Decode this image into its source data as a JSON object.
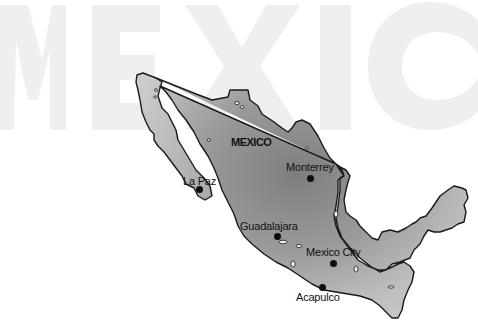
{
  "map": {
    "title_watermark": "MEXICO",
    "country_label": "MEXICO",
    "colors": {
      "background": "#ffffff",
      "watermark": "#efefef",
      "land_light": "#cfcfcf",
      "land_dark": "#7a7a7a",
      "outline": "#1a1a1a",
      "city_dot": "#0d0d0d",
      "text": "#111111"
    },
    "cities": [
      {
        "name": "Monterrey",
        "label_x": 286,
        "label_y": 161,
        "dot_x": 307,
        "dot_y": 175
      },
      {
        "name": "La Paz",
        "label_x": 183,
        "label_y": 175,
        "dot_x": 196,
        "dot_y": 186
      },
      {
        "name": "Guadalajara",
        "label_x": 240,
        "label_y": 220,
        "dot_x": 274,
        "dot_y": 233
      },
      {
        "name": "Mexico City",
        "label_x": 306,
        "label_y": 246,
        "dot_x": 330,
        "dot_y": 260
      },
      {
        "name": "Acapulco",
        "label_x": 296,
        "label_y": 291,
        "dot_x": 319,
        "dot_y": 284
      }
    ]
  }
}
